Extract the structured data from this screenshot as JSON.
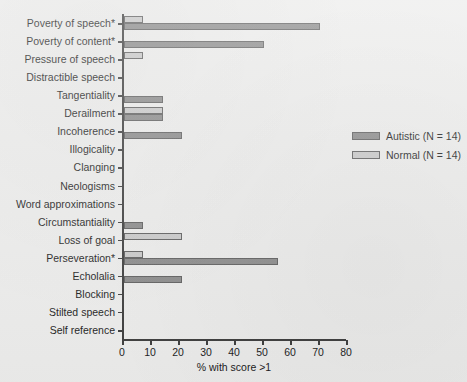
{
  "chart_data": {
    "type": "bar",
    "orientation": "horizontal",
    "title": "",
    "xlabel": "% with score >1",
    "ylabel": "",
    "xlim": [
      0,
      80
    ],
    "xticks": [
      0,
      10,
      20,
      30,
      40,
      50,
      60,
      70,
      80
    ],
    "grid": false,
    "legend_position": "right-middle",
    "categories": [
      "Poverty of speech*",
      "Poverty of content*",
      "Pressure of speech",
      "Distractible speech",
      "Tangentiality",
      "Derailment",
      "Incoherence",
      "Illogicality",
      "Clanging",
      "Neologisms",
      "Word approximations",
      "Circumstantiality",
      "Loss of goal",
      "Perseveration*",
      "Echolalia",
      "Blocking",
      "Stilted speech",
      "Self reference"
    ],
    "series": [
      {
        "name": "Autistic (N = 14)",
        "color": "#8a8a8a",
        "values": [
          70,
          50,
          0,
          0,
          14,
          14,
          21,
          0,
          0,
          0,
          0,
          7,
          0,
          55,
          21,
          0,
          0,
          0
        ]
      },
      {
        "name": "Normal (N = 14)",
        "color": "#c9c9c9",
        "values": [
          7,
          0,
          7,
          0,
          0,
          14,
          0,
          0,
          0,
          0,
          0,
          0,
          21,
          7,
          0,
          0,
          0,
          0
        ]
      }
    ],
    "legend": [
      {
        "label": "Autistic (N = 14)",
        "swatch": "#8a8a8a"
      },
      {
        "label": "Normal (N = 14)",
        "swatch": "#c9c9c9"
      }
    ],
    "footnote_marker": "*"
  }
}
